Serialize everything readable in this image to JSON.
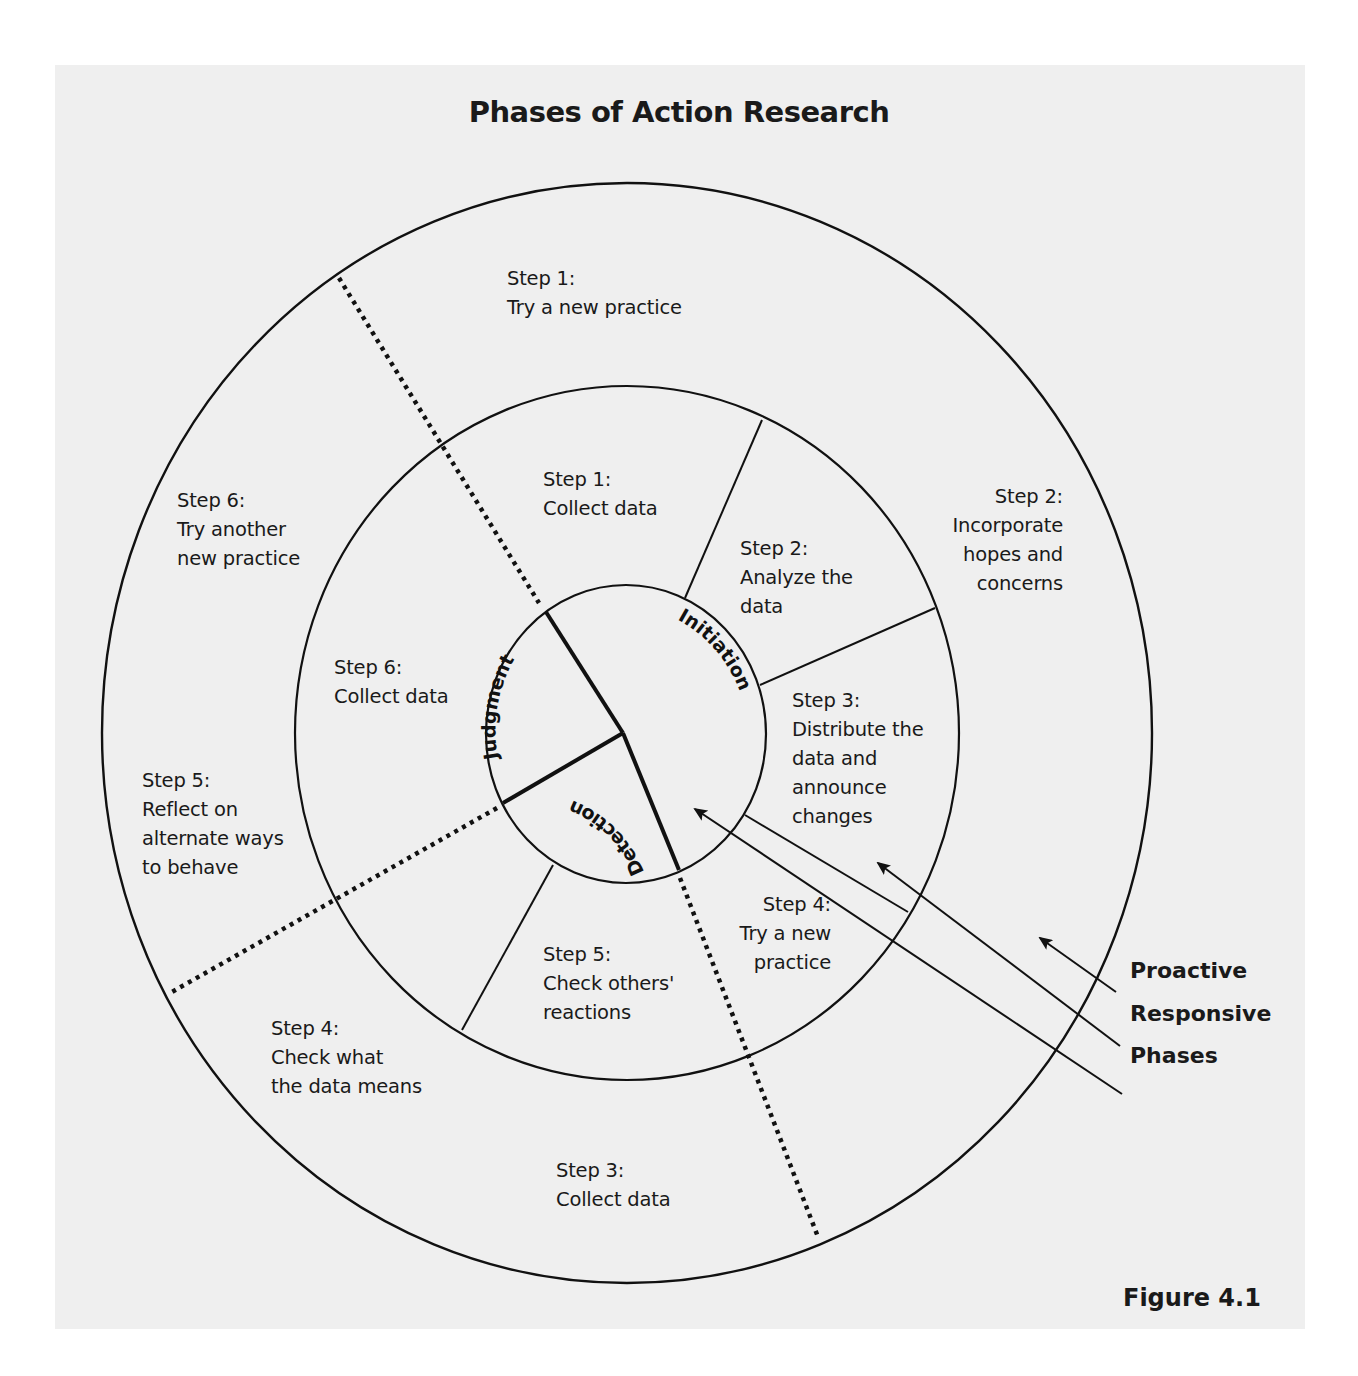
{
  "title": "Phases of Action Research",
  "figure_label": "Figure 4.1",
  "colors": {
    "background": "#efefef",
    "stroke": "#111111",
    "text": "#1a1a1a"
  },
  "phases": [
    {
      "name": "Initiation"
    },
    {
      "name": "Detection"
    },
    {
      "name": "Judgment"
    }
  ],
  "outer_ring": {
    "name": "Proactive",
    "steps": [
      {
        "step": "Step 1:",
        "text": "Try a new practice"
      },
      {
        "step": "Step 2:",
        "text": "Incorporate\nhopes and\nconcerns"
      },
      {
        "step": "Step 3:",
        "text": "Collect data"
      },
      {
        "step": "Step 4:",
        "text": "Check what\nthe data means"
      },
      {
        "step": "Step 5:",
        "text": "Reflect on\nalternate ways\nto behave"
      },
      {
        "step": "Step 6:",
        "text": "Try another\nnew practice"
      }
    ]
  },
  "middle_ring": {
    "name": "Responsive",
    "steps": [
      {
        "step": "Step 1:",
        "text": "Collect data"
      },
      {
        "step": "Step 2:",
        "text": "Analyze the\ndata"
      },
      {
        "step": "Step 3:",
        "text": "Distribute the\ndata and\nannounce\nchanges"
      },
      {
        "step": "Step 4:",
        "text": "Try a new\npractice"
      },
      {
        "step": "Step 5:",
        "text": "Check others'\nreactions"
      },
      {
        "step": "Step 6:",
        "text": "Collect data"
      }
    ]
  },
  "legend": [
    {
      "label": "Proactive"
    },
    {
      "label": "Responsive"
    },
    {
      "label": "Phases"
    }
  ]
}
